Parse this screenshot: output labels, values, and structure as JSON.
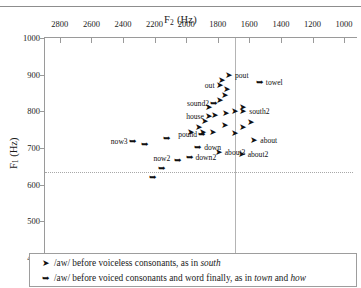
{
  "top_remnant": "",
  "chart_data": {
    "type": "scatter",
    "title": "",
    "xlabel": "F2 (Hz)",
    "ylabel": "F1 (Hz)",
    "xlabel_main": "F",
    "xlabel_sub": "2",
    "xlabel_unit": " (Hz)",
    "ylabel_main": "F",
    "ylabel_sub": "1",
    "ylabel_unit": " (Hz)",
    "xlim": [
      2900,
      950
    ],
    "ylim": [
      1000,
      400
    ],
    "x_inverted": true,
    "y_inverted": true,
    "grid": false,
    "legend_position": "below-plot",
    "xticks": [
      2800,
      2600,
      2400,
      2200,
      2000,
      1800,
      1600,
      1400,
      1200,
      1000
    ],
    "yticks": [
      400,
      500,
      600,
      700,
      800,
      900,
      1000
    ],
    "reference_lines": {
      "vertical_f2": 1700,
      "horizontal_f1": 635
    },
    "series": [
      {
        "name": "/aw/ before voiceless consonants, as in south",
        "marker": "arrow-filled",
        "legend_main": "/aw/ before voiceless consonants, as in ",
        "legend_italic": "south",
        "legend_tail": ""
      },
      {
        "name": "/aw/ before voiced consonants and word finally, as in town and how",
        "marker": "arrow-open",
        "legend_main": "/aw/ before voiced consonants and word finally, as in ",
        "legend_italic": "town",
        "legend_mid": " and ",
        "legend_italic2": "how",
        "legend_tail": ""
      }
    ],
    "points": [
      {
        "label": "now2",
        "f2": 2160,
        "f1": 645,
        "label_pos": "top",
        "series": 1
      },
      {
        "label": "down2",
        "f2": 1985,
        "f1": 676,
        "label_pos": "rgt",
        "series": 1
      },
      {
        "label": "down",
        "f2": 1930,
        "f1": 703,
        "label_pos": "rgt",
        "series": 1
      },
      {
        "label": "now3",
        "f2": 2345,
        "f1": 718,
        "label_pos": "lft",
        "series": 1
      },
      {
        "label": "about3",
        "f2": 1800,
        "f1": 690,
        "label_pos": "rgt",
        "series": 0
      },
      {
        "label": "about2",
        "f2": 1655,
        "f1": 684,
        "label_pos": "rgt",
        "series": 0
      },
      {
        "label": "pound",
        "f2": 1905,
        "f1": 737,
        "label_pos": "lft",
        "series": 1
      },
      {
        "label": "about",
        "f2": 1575,
        "f1": 722,
        "label_pos": "rgt",
        "series": 0
      },
      {
        "label": "house",
        "f2": 1862,
        "f1": 787,
        "label_pos": "lft",
        "series": 0
      },
      {
        "label": "south2",
        "f2": 1645,
        "f1": 800,
        "label_pos": "rgt",
        "series": 0
      },
      {
        "label": "sound2",
        "f2": 1830,
        "f1": 823,
        "label_pos": "lft",
        "series": 1
      },
      {
        "label": "out",
        "f2": 1795,
        "f1": 871,
        "label_pos": "lft",
        "series": 0
      },
      {
        "label": "pout",
        "f2": 1735,
        "f1": 898,
        "label_pos": "rgt",
        "series": 0
      },
      {
        "label": "towel",
        "f2": 1540,
        "f1": 880,
        "label_pos": "rgt",
        "series": 1
      },
      {
        "label": "",
        "f2": 2215,
        "f1": 620,
        "label_pos": "none",
        "series": 1
      },
      {
        "label": "",
        "f2": 2055,
        "f1": 668,
        "label_pos": "none",
        "series": 1
      },
      {
        "label": "",
        "f2": 2270,
        "f1": 712,
        "label_pos": "none",
        "series": 1
      },
      {
        "label": "",
        "f2": 2130,
        "f1": 727,
        "label_pos": "none",
        "series": 1
      },
      {
        "label": "",
        "f2": 1975,
        "f1": 745,
        "label_pos": "none",
        "series": 0
      },
      {
        "label": "",
        "f2": 1925,
        "f1": 757,
        "label_pos": "none",
        "series": 0
      },
      {
        "label": "",
        "f2": 1835,
        "f1": 745,
        "label_pos": "none",
        "series": 0
      },
      {
        "label": "",
        "f2": 1762,
        "f1": 763,
        "label_pos": "none",
        "series": 0
      },
      {
        "label": "",
        "f2": 1700,
        "f1": 742,
        "label_pos": "none",
        "series": 0
      },
      {
        "label": "",
        "f2": 1648,
        "f1": 757,
        "label_pos": "none",
        "series": 0
      },
      {
        "label": "",
        "f2": 1598,
        "f1": 772,
        "label_pos": "none",
        "series": 0
      },
      {
        "label": "",
        "f2": 1885,
        "f1": 775,
        "label_pos": "none",
        "series": 0
      },
      {
        "label": "",
        "f2": 1822,
        "f1": 790,
        "label_pos": "none",
        "series": 0
      },
      {
        "label": "",
        "f2": 1755,
        "f1": 795,
        "label_pos": "none",
        "series": 0
      },
      {
        "label": "",
        "f2": 1700,
        "f1": 800,
        "label_pos": "none",
        "series": 0
      },
      {
        "label": "",
        "f2": 1645,
        "f1": 812,
        "label_pos": "none",
        "series": 0
      },
      {
        "label": "",
        "f2": 1795,
        "f1": 830,
        "label_pos": "none",
        "series": 0
      },
      {
        "label": "",
        "f2": 1760,
        "f1": 845,
        "label_pos": "none",
        "series": 0
      },
      {
        "label": "",
        "f2": 1745,
        "f1": 860,
        "label_pos": "none",
        "series": 0
      },
      {
        "label": "",
        "f2": 1782,
        "f1": 885,
        "label_pos": "none",
        "series": 0
      },
      {
        "label": "",
        "f2": 1900,
        "f1": 745,
        "label_pos": "none",
        "series": 0
      },
      {
        "label": "",
        "f2": 1862,
        "f1": 812,
        "label_pos": "none",
        "series": 0
      }
    ]
  }
}
